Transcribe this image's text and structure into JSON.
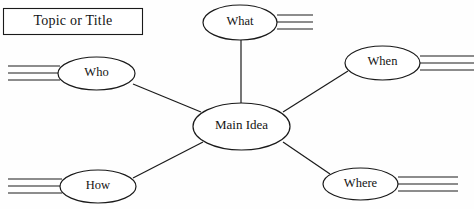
{
  "diagram": {
    "type": "web-graphic-organizer",
    "stroke_color": "#1a1a1a",
    "background_color": "#fefefe",
    "title_box": {
      "label": "Topic or Title",
      "x": 3,
      "y": 8,
      "width": 140,
      "height": 27
    },
    "center_node": {
      "label": "Main Idea",
      "cx": 241.5,
      "cy": 126.5,
      "rx": 48.5,
      "ry": 23.5
    },
    "branch_nodes": [
      {
        "id": "what",
        "label": "What",
        "cx": 240,
        "cy": 22.5,
        "rx": 37,
        "ry": 17.5,
        "writing_lines_side": "right",
        "writing_lines_count": 3,
        "writing_line_x_start": 277,
        "writing_line_x_end": 313,
        "writing_line_ys": [
          15,
          22,
          29
        ]
      },
      {
        "id": "who",
        "label": "Who",
        "cx": 96.5,
        "cy": 73.5,
        "rx": 38.5,
        "ry": 16.5,
        "writing_lines_side": "left",
        "writing_lines_count": 3,
        "writing_line_x_start": 8,
        "writing_line_x_end": 60,
        "writing_line_ys": [
          66,
          73,
          80
        ]
      },
      {
        "id": "when",
        "label": "When",
        "cx": 382.5,
        "cy": 63,
        "rx": 37.5,
        "ry": 17,
        "writing_lines_side": "right",
        "writing_lines_count": 3,
        "writing_line_x_start": 420,
        "writing_line_x_end": 474,
        "writing_line_ys": [
          56,
          63,
          70
        ]
      },
      {
        "id": "how",
        "label": "How",
        "cx": 98,
        "cy": 186.5,
        "rx": 38,
        "ry": 16.5,
        "writing_lines_side": "left",
        "writing_lines_count": 3,
        "writing_line_x_start": 8,
        "writing_line_x_end": 62,
        "writing_line_ys": [
          179,
          186,
          193
        ]
      },
      {
        "id": "where",
        "label": "Where",
        "cx": 360.5,
        "cy": 184,
        "rx": 37.5,
        "ry": 16,
        "writing_lines_side": "right",
        "writing_lines_count": 3,
        "writing_line_x_start": 398,
        "writing_line_x_end": 458,
        "writing_line_ys": [
          177,
          184,
          191
        ]
      }
    ],
    "connectors": [
      {
        "id": "main-to-what",
        "x1": 241,
        "y1": 103,
        "x2": 241,
        "y2": 40
      },
      {
        "id": "main-to-who",
        "x1": 201,
        "y1": 112,
        "x2": 133,
        "y2": 84
      },
      {
        "id": "main-to-when",
        "x1": 283,
        "y1": 112,
        "x2": 348,
        "y2": 71
      },
      {
        "id": "main-to-how",
        "x1": 203,
        "y1": 142,
        "x2": 133,
        "y2": 178
      },
      {
        "id": "main-to-where",
        "x1": 283,
        "y1": 142,
        "x2": 330,
        "y2": 174
      }
    ]
  }
}
